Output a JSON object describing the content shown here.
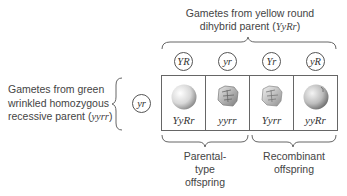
{
  "top_parent": {
    "line1": "Gametes from yellow round",
    "line2_prefix": "dihybrid parent (",
    "line2_genotype": "YyRr",
    "line2_suffix": ")"
  },
  "left_parent": {
    "line1": "Gametes from green",
    "line2": "wrinkled homozygous",
    "line3_prefix": "recessive parent (",
    "line3_genotype": "yyrr",
    "line3_suffix": ")"
  },
  "top_gametes": [
    "YR",
    "yr",
    "Yr",
    "yR"
  ],
  "left_gamete": "yr",
  "offspring": [
    {
      "genotype": "YyRr",
      "phenotype": "yellow round",
      "shape": "round"
    },
    {
      "genotype": "yyrr",
      "phenotype": "green wrinkled",
      "shape": "wrinkled"
    },
    {
      "genotype": "Yyrr",
      "phenotype": "yellow wrinkled",
      "shape": "wrinkled"
    },
    {
      "genotype": "yyRr",
      "phenotype": "green round",
      "shape": "round"
    }
  ],
  "groups": {
    "parental": {
      "line1": "Parental-",
      "line2": "type",
      "line3": "offspring"
    },
    "recombinant": {
      "line1": "Recombinant",
      "line2": "offspring"
    }
  }
}
